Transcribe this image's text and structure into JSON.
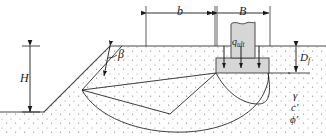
{
  "figure": {
    "type": "geotechnical-cross-section"
  },
  "labels": {
    "edge_distance": "b",
    "footing_width": "B",
    "slope_height": "H",
    "slope_angle": "β",
    "embedment_depth_main": "D",
    "embedment_depth_sub": "f",
    "bearing_pressure_main": "q",
    "bearing_pressure_sub": "ult",
    "unit_weight": "γ",
    "cohesion_main": "c",
    "cohesion_prime": "′",
    "friction_main": "ϕ",
    "friction_prime": "′"
  },
  "colors": {
    "line": "#1a1a1a",
    "soil_fill": "#ffffff",
    "soil_stipple": "#8a8a8a",
    "concrete_fill": "#d6d6d6",
    "concrete_edge": "#4d4d4d",
    "ground_line": "#4a4a4a",
    "background": "#ffffff"
  },
  "geometry": {
    "ground_surface_y": 46,
    "slope_crest_x": 110,
    "slope_toe": [
      44,
      112
    ],
    "footing_base_y": 73,
    "footing_left_x": 216,
    "footing_right_x": 269,
    "column_left_x": 231,
    "column_right_x": 255,
    "column_top_y": 22,
    "wedge_apex": [
      82,
      90
    ],
    "dim_b_from": 146,
    "dim_b_to": 214,
    "dim_B_from": 217,
    "dim_B_to": 270,
    "dim_H_top_y": 46,
    "dim_H_bottom_y": 112,
    "dim_Df_top_y": 46,
    "dim_Df_bottom_y": 73
  },
  "load_arrows": {
    "count": 3,
    "x_positions": [
      224,
      241,
      259
    ],
    "from_y": 58,
    "to_y": 72
  }
}
